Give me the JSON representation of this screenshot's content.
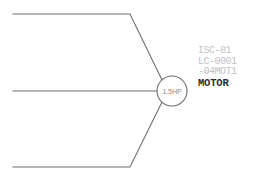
{
  "drawing": {
    "background_color": "#ffffff",
    "line_color": "#6e6e74",
    "motor_symbol": {
      "rating_label": "1.5HP",
      "center_x": 172,
      "center_y": 91,
      "radius": 15
    },
    "feeders": [
      {
        "name": "upper-feeder",
        "path": "M 13 14 L 130 14 L 162 80"
      },
      {
        "name": "middle-feeder",
        "path": "M 13 91 L 157 91"
      },
      {
        "name": "lower-feeder",
        "path": "M 13 167 L 130 167 L 162 102"
      }
    ]
  },
  "tag_block": {
    "color_reference": "#c2c2c6",
    "color_name": "#2b2b30",
    "lines": [
      "ISC-01",
      "LC-0001",
      "-04MOT1"
    ],
    "equipment_name": "MOTOR"
  }
}
